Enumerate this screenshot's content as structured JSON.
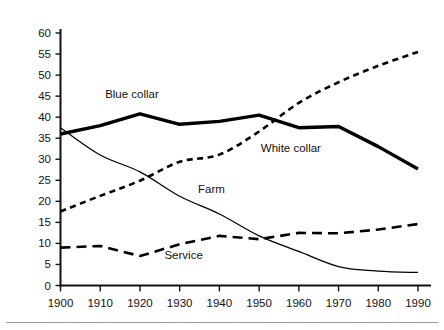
{
  "chart_data": {
    "type": "line",
    "title": "",
    "subtitle": "",
    "xlabel": "",
    "ylabel": "",
    "x": [
      1900,
      1910,
      1920,
      1930,
      1940,
      1950,
      1960,
      1970,
      1980,
      1990
    ],
    "categories": [
      "1900",
      "1910",
      "1920",
      "1930",
      "1940",
      "1950",
      "1960",
      "1970",
      "1980",
      "1990"
    ],
    "xlim": [
      1900,
      1990
    ],
    "ylim": [
      0,
      60
    ],
    "ytick_values": [
      0,
      5,
      10,
      15,
      20,
      25,
      30,
      35,
      40,
      45,
      50,
      55,
      60
    ],
    "ytick_labels": [
      "0",
      "5",
      "10",
      "15",
      "20",
      "25",
      "30",
      "35",
      "40",
      "45",
      "50",
      "55",
      "60"
    ],
    "xtick_labels": [
      "1900",
      "1910",
      "1920",
      "1930",
      "1940",
      "1950",
      "1960",
      "1970",
      "1980",
      "1990"
    ],
    "grid": false,
    "legend_position": "inline-annotations",
    "series": [
      {
        "name": "Blue collar",
        "style": "solid-thick",
        "label_x": 1918,
        "label_y": 44.5,
        "values": [
          36.0,
          38.0,
          40.8,
          38.3,
          39.0,
          40.5,
          37.5,
          37.8,
          33.0,
          27.7
        ]
      },
      {
        "name": "White collar",
        "style": "dotted",
        "label_x": 1958,
        "label_y": 31.8,
        "values": [
          17.6,
          21.3,
          24.9,
          29.4,
          31.1,
          36.6,
          43.4,
          48.3,
          52.2,
          55.5
        ]
      },
      {
        "name": "Farm",
        "style": "thin-solid",
        "label_x": 1938,
        "label_y": 22.0,
        "values": [
          37.5,
          31.0,
          27.0,
          21.2,
          17.0,
          11.8,
          8.1,
          4.5,
          3.4,
          3.1
        ]
      },
      {
        "name": "Service",
        "style": "dashed",
        "label_x": 1931,
        "label_y": 6.3,
        "values": [
          9.0,
          9.4,
          7.0,
          9.8,
          11.8,
          11.0,
          12.5,
          12.4,
          13.3,
          14.6
        ]
      }
    ],
    "annotations": [
      {
        "text": "Blue collar",
        "x": 1918,
        "y": 44.5
      },
      {
        "text": "White collar",
        "x": 1958,
        "y": 31.8
      },
      {
        "text": "Farm",
        "x": 1938,
        "y": 22.0
      },
      {
        "text": "Service",
        "x": 1931,
        "y": 6.3
      }
    ],
    "colors": {
      "axis": "#111111",
      "series": "#000000",
      "background": "#ffffff",
      "footer_rule": "#9a9a9a"
    }
  }
}
